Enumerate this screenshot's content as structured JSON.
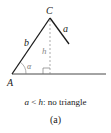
{
  "figure": {
    "labels": {
      "vertex_A": "A",
      "vertex_C": "C",
      "side_a": "a",
      "side_b": "b",
      "height_h": "h",
      "angle_alpha": "α"
    },
    "caption": {
      "var_a": "a",
      "less_than": " < ",
      "var_h": "h",
      "text": ": no triangle"
    },
    "panel_label": "(a)",
    "colors": {
      "line": "#1a1a1a",
      "dashed": "#888888"
    }
  }
}
